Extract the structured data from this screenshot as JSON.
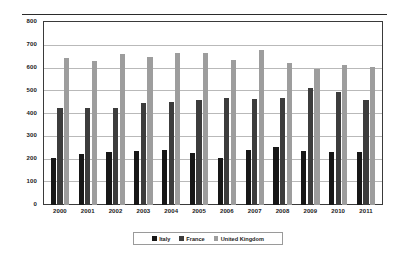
{
  "chart_data": {
    "type": "bar",
    "title": "",
    "xlabel": "",
    "ylabel": "",
    "ylim": [
      0,
      800
    ],
    "ytick_step": 100,
    "yticks": [
      800,
      700,
      600,
      500,
      400,
      300,
      200,
      100,
      0
    ],
    "grid": true,
    "legend_position": "bottom",
    "categories": [
      "2000",
      "2001",
      "2002",
      "2003",
      "2004",
      "2005",
      "2006",
      "2007",
      "2008",
      "2009",
      "2010",
      "2011"
    ],
    "series": [
      {
        "name": "Italy",
        "color": "#171717",
        "values": [
          207,
          221,
          232,
          234,
          240,
          228,
          204,
          239,
          254,
          235,
          232,
          233
        ]
      },
      {
        "name": "France",
        "color": "#3c3c3c",
        "values": [
          426,
          423,
          426,
          445,
          449,
          457,
          466,
          465,
          470,
          511,
          495,
          461
        ]
      },
      {
        "name": "United Kingdom",
        "color": "#9d9d9d",
        "values": [
          643,
          628,
          658,
          645,
          663,
          666,
          633,
          678,
          622,
          594,
          614,
          604
        ]
      }
    ]
  },
  "legend": {
    "items": [
      {
        "label": "Italy",
        "swatch": "italy"
      },
      {
        "label": "France",
        "swatch": "france"
      },
      {
        "label": "United Kingdom",
        "swatch": "uk"
      }
    ]
  }
}
